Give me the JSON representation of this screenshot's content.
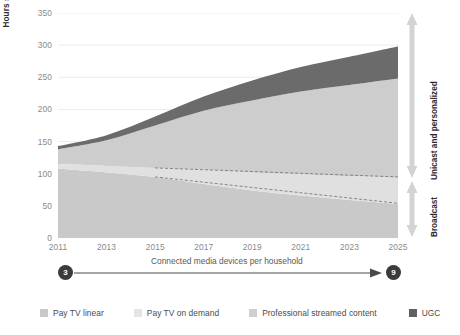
{
  "chart_data": {
    "type": "area",
    "title": "",
    "ylabel": "Hours spent per household per month (global)",
    "xlabel": "",
    "ylim": [
      0,
      350
    ],
    "xlim": [
      2011,
      2025
    ],
    "grid": true,
    "stacked": true,
    "legend_position": "bottom",
    "x": [
      2011,
      2013,
      2015,
      2017,
      2019,
      2021,
      2023,
      2025
    ],
    "ytick_labels": [
      "0",
      "50",
      "100",
      "150",
      "200",
      "250",
      "300",
      "350"
    ],
    "ytick_values": [
      0,
      50,
      100,
      150,
      200,
      250,
      300,
      350
    ],
    "xtick_labels": [
      "2011",
      "2013",
      "2015",
      "2017",
      "2019",
      "2021",
      "2023",
      "2025"
    ],
    "series": [
      {
        "name": "Pay TV linear",
        "color": "#c9c9c9",
        "values": [
          108,
          102,
          95,
          84,
          74,
          66,
          59,
          53
        ]
      },
      {
        "name": "Pay TV on demand",
        "color": "#e0e0e0",
        "values": [
          7,
          10,
          14,
          22,
          28,
          33,
          37,
          41
        ]
      },
      {
        "name": "Professional streamed content",
        "color": "#cdcdcd",
        "values": [
          23,
          40,
          66,
          92,
          112,
          129,
          142,
          154
        ]
      },
      {
        "name": "UGC",
        "color": "#6b6b6b",
        "values": [
          5,
          8,
          14,
          22,
          31,
          38,
          44,
          50
        ]
      }
    ],
    "total_values": [
      143,
      160,
      189,
      220,
      245,
      266,
      282,
      298
    ],
    "annotation_lines": [
      {
        "name": "upper-dashed",
        "x": [
          2015,
          2025
        ],
        "y": [
          109,
          95
        ]
      },
      {
        "name": "lower-dashed",
        "x": [
          2015,
          2025
        ],
        "y": [
          95,
          54
        ]
      }
    ]
  },
  "axis": {
    "y_title": "Hours spent per household per month (global)",
    "y_ticks": [
      "350",
      "300",
      "250",
      "200",
      "150",
      "100",
      "50",
      "0"
    ],
    "x_ticks": [
      "2011",
      "2013",
      "2015",
      "2017",
      "2019",
      "2021",
      "2023",
      "2025"
    ]
  },
  "right_annotations": [
    {
      "label": "Unicast and personalized"
    },
    {
      "label": "Broadcast"
    }
  ],
  "connector": {
    "start_value": "3",
    "end_value": "9",
    "label": "Connected media devices per household"
  },
  "legend": {
    "items": [
      {
        "label": "Pay TV linear",
        "color": "#c9c9c9"
      },
      {
        "label": "Pay TV on demand",
        "color": "#e4e4e4"
      },
      {
        "label": "Professional streamed content",
        "color": "#cfcfcf"
      },
      {
        "label": "UGC",
        "color": "#5f5f5f"
      }
    ]
  },
  "colors": {
    "grid": "#ececec",
    "tick_text": "#8a8a8a",
    "label_text": "#2b2b2b",
    "arrow": "#d2d2d2",
    "dark": "#3b3b3b"
  }
}
